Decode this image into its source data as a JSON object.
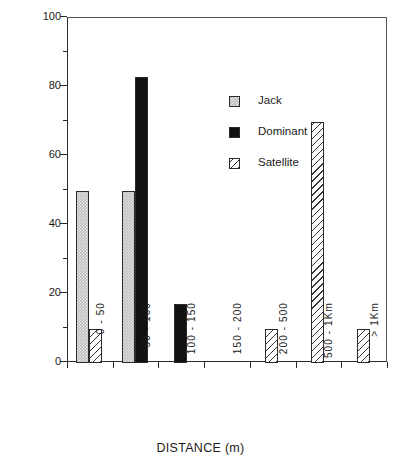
{
  "chart_data": {
    "type": "bar",
    "title": "",
    "xlabel": "DISTANCE (m)",
    "ylabel": "PERCENT OF MALES",
    "ylim": [
      0,
      100
    ],
    "ytick_labels": [
      "0",
      "20",
      "40",
      "60",
      "80",
      "100"
    ],
    "ytick_values": [
      0,
      20,
      40,
      60,
      80,
      100
    ],
    "yminor_values": [
      10,
      30,
      50,
      70,
      90
    ],
    "grid": false,
    "legend_position": "inside-upper-center",
    "categories": [
      "0 - 50",
      "50 - 100",
      "100 - 150",
      "150 - 200",
      "200 - 500",
      "500 - 1Km",
      "> 1Km"
    ],
    "series": [
      {
        "name": "Jack",
        "color": "#bdbdbd",
        "pattern": "stipple",
        "values": [
          50,
          50,
          0,
          0,
          0,
          0,
          0
        ]
      },
      {
        "name": "Dominant",
        "color": "#111111",
        "pattern": "solid",
        "values": [
          0,
          83,
          17,
          0,
          0,
          0,
          0
        ]
      },
      {
        "name": "Satellite",
        "color": "#ffffff",
        "pattern": "diagonal-hatch",
        "values": [
          10,
          0,
          0,
          0,
          10,
          70,
          10
        ]
      }
    ]
  },
  "legend": {
    "items": [
      {
        "label": "Jack"
      },
      {
        "label": "Dominant"
      },
      {
        "label": "Satellite"
      }
    ]
  }
}
